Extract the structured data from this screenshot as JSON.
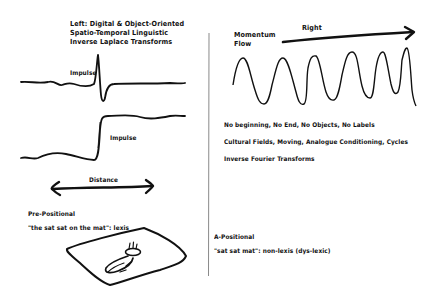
{
  "left": {
    "heading_lines": [
      "Left: Digital & Object-Oriented",
      "Spatio-Temporal Linguistic",
      "Inverse Laplace Transforms"
    ],
    "impulse_label_1": "Impulse",
    "impulse_label_2": "Impulse",
    "distance_label": "Distance",
    "prepositional_title": "Pre-Positional",
    "prepositional_example": "\"the sat sat on the mat\": lexis",
    "icons": {
      "impulse_wave": "impulse-spike-waveform",
      "step_wave": "step-waveform",
      "distance_arrow": "double-headed-arrow",
      "cat_on_mat": "cat-on-mat-sketch"
    }
  },
  "right": {
    "right_label": "Right",
    "momentum_label_lines": [
      "Momentum",
      "Flow"
    ],
    "statements": [
      "No beginning, No End, No Objects, No Labels",
      "Cultural Fields, Moving, Analogue Conditioning, Cycles",
      "Inverse Fourier Transforms"
    ],
    "apositional_title": "A-Positional",
    "apositional_example": "\"sat sat mat\": non-lexis (dys-lexic)",
    "icons": {
      "flow_arrow": "right-arrow",
      "sine_wave": "sine-waveform"
    }
  },
  "colors": {
    "ink": "#111111",
    "divider": "#8a8a8a",
    "background": "#ffffff"
  }
}
